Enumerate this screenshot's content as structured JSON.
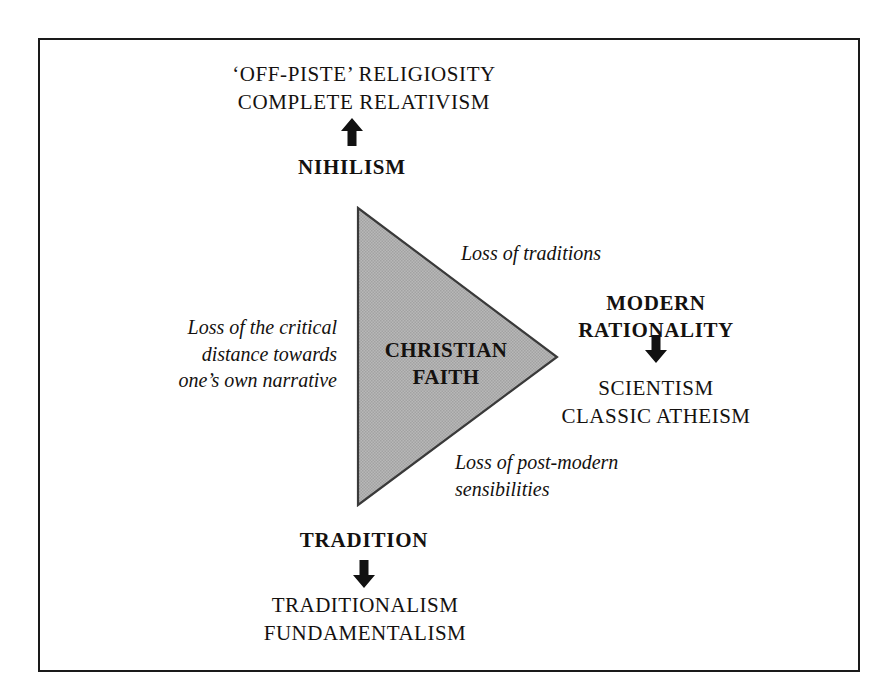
{
  "diagram": {
    "frame": {
      "border_color": "#1a1a1a",
      "background": "#ffffff"
    },
    "shape": {
      "name": "christian-faith-triangle",
      "orientation": "right-pointing",
      "fill": "#b3b3b3",
      "stroke": "#333333",
      "label_line1": "CHRISTIAN",
      "label_line2": "FAITH"
    },
    "nodes": {
      "top": {
        "outcome_line1": "‘OFF-PISTE’ RELIGIOSITY",
        "outcome_line2": "COMPLETE RELATIVISM",
        "arrow": "arrow-up",
        "source": "NIHILISM"
      },
      "right": {
        "source_line1": "MODERN",
        "source_line2": "RATIONALITY",
        "arrow": "arrow-down",
        "outcome_line1": "SCIENTISM",
        "outcome_line2": "CLASSIC ATHEISM"
      },
      "bottom": {
        "source": "TRADITION",
        "arrow": "arrow-down",
        "outcome_line1": "TRADITIONALISM",
        "outcome_line2": "FUNDAMENTALISM"
      }
    },
    "edge_labels": {
      "upper_right": "Loss of traditions",
      "left_line1": "Loss of the critical",
      "left_line2": "distance towards",
      "left_line3": "one’s own narrative",
      "lower_right_line1": "Loss of post-modern",
      "lower_right_line2": "sensibilities"
    }
  }
}
